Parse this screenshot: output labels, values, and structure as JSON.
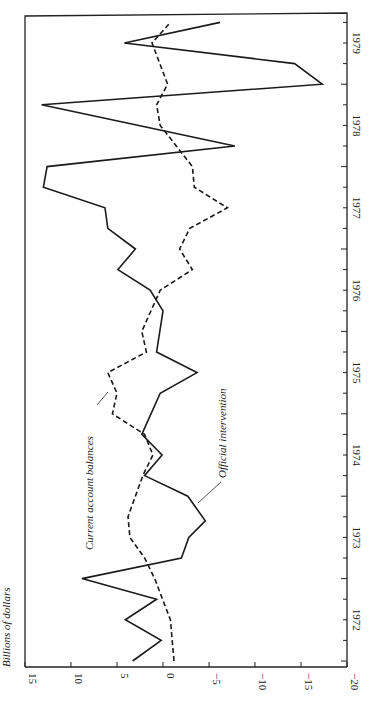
{
  "chart_data": {
    "type": "line",
    "orientation": "rotated-90",
    "title": "",
    "ylabel": "Billions of dollars",
    "xlabel": "",
    "ylim": [
      -20,
      15
    ],
    "yticks": [
      15,
      10,
      5,
      0,
      -5,
      -10,
      -15,
      -20
    ],
    "ytick_labels": [
      "15",
      "10",
      "5",
      "0",
      "−5",
      "−10",
      "−15",
      "−20"
    ],
    "xticks": [
      "1972",
      "1973",
      "1974",
      "1975",
      "1976",
      "1977",
      "1978",
      "1979"
    ],
    "xlim": [
      1972.0,
      1979.9
    ],
    "grid": false,
    "series": [
      {
        "name": "Official intervention",
        "style": "solid",
        "x": [
          1972.0,
          1972.25,
          1972.5,
          1972.75,
          1973.0,
          1973.25,
          1973.5,
          1973.7,
          1974.0,
          1974.25,
          1974.5,
          1974.75,
          1975.25,
          1975.5,
          1975.75,
          1976.25,
          1976.5,
          1976.75,
          1977.0,
          1977.25,
          1977.5,
          1977.75,
          1978.0,
          1978.25,
          1978.75,
          1979.0,
          1979.25,
          1979.5,
          1979.75
        ],
        "values": [
          3.3,
          0.2,
          4.1,
          0.7,
          8.8,
          -2.0,
          -2.8,
          -4.6,
          -2.7,
          2.0,
          0.1,
          2.3,
          0.3,
          -3.7,
          0.7,
          0.0,
          1.4,
          4.9,
          3.0,
          6.0,
          6.3,
          13.0,
          12.6,
          -7.8,
          13.2,
          -17.3,
          -14.3,
          4.2,
          -6.2
        ]
      },
      {
        "name": "Current account balances",
        "style": "dashed",
        "x": [
          1972.0,
          1972.5,
          1973.0,
          1973.25,
          1973.5,
          1973.75,
          1974.0,
          1974.25,
          1974.5,
          1974.75,
          1975.0,
          1975.25,
          1975.5,
          1975.75,
          1976.0,
          1976.5,
          1976.75,
          1977.0,
          1977.25,
          1977.5,
          1977.75,
          1978.0,
          1978.5,
          1978.75,
          1979.0,
          1979.5,
          1979.75
        ],
        "values": [
          -1.2,
          -0.8,
          0.9,
          2.0,
          3.6,
          3.8,
          3.0,
          2.2,
          1.1,
          2.0,
          5.5,
          5.0,
          6.0,
          1.8,
          2.3,
          0.3,
          -3.2,
          -1.8,
          -2.9,
          -7.0,
          -3.4,
          -3.2,
          0.3,
          0.7,
          -0.5,
          1.2,
          -0.8
        ]
      }
    ],
    "annotations": [
      "Current account balances",
      "Official intervention"
    ]
  }
}
